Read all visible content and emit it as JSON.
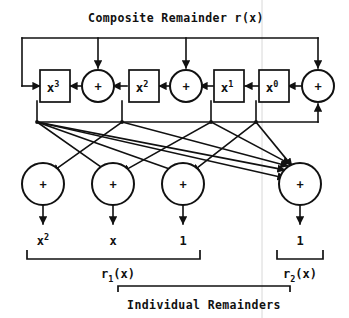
{
  "figure": {
    "title": "Composite Remainder r(x)",
    "caption": "Individual Remainders",
    "adder_symbol": "+"
  },
  "registers": [
    {
      "id": "reg-x3",
      "base": "x",
      "exponent": "3",
      "cx": 54,
      "cy": 86
    },
    {
      "id": "reg-x2",
      "base": "x",
      "exponent": "2",
      "cx": 143,
      "cy": 86
    },
    {
      "id": "reg-x1",
      "base": "x",
      "exponent": "1",
      "cx": 229,
      "cy": 86
    },
    {
      "id": "reg-x0",
      "base": "x",
      "exponent": "0",
      "cx": 274,
      "cy": 86
    }
  ],
  "top_adders": [
    {
      "id": "adder-top-1",
      "cx": 98,
      "cy": 86
    },
    {
      "id": "adder-top-2",
      "cx": 186,
      "cy": 86
    },
    {
      "id": "adder-top-3",
      "cx": 318,
      "cy": 86
    }
  ],
  "bottom_adders": [
    {
      "id": "adder-bottom-1",
      "cx": 43,
      "cy": 184
    },
    {
      "id": "adder-bottom-2",
      "cx": 113,
      "cy": 184
    },
    {
      "id": "adder-bottom-3",
      "cx": 183,
      "cy": 184
    },
    {
      "id": "adder-bottom-4",
      "cx": 300,
      "cy": 184
    }
  ],
  "outputs": [
    {
      "id": "output-x2",
      "base": "x",
      "exponent": "2",
      "x": 43
    },
    {
      "id": "output-x",
      "base": "x",
      "exponent": "",
      "x": 113
    },
    {
      "id": "output-1",
      "base": "1",
      "exponent": "",
      "x": 183
    },
    {
      "id": "output-1b",
      "base": "1",
      "exponent": "",
      "x": 300
    }
  ],
  "groups": [
    {
      "id": "group-r1",
      "base": "r",
      "subscript": "1",
      "suffix": "(x)",
      "x": 134,
      "left": 27,
      "right": 200
    },
    {
      "id": "group-r2",
      "base": "r",
      "subscript": "2",
      "suffix": "(x)",
      "x": 300,
      "left": 277,
      "right": 323
    }
  ]
}
